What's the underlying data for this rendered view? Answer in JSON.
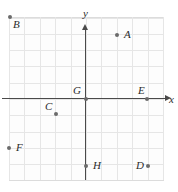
{
  "figure": {
    "background_color": "#ffffff",
    "grid_color": "#e6e6e6",
    "axis_color": "#4a4a4a",
    "point_color": "#6b6b6b",
    "label_color": "#2b2b2b"
  },
  "axes": {
    "x_label": "x",
    "y_label": "y",
    "origin_px": {
      "x": 86,
      "y": 99
    },
    "unit_px": {
      "x": 15.4,
      "y": 16.3
    },
    "x_range": [
      -5,
      5
    ],
    "y_range": [
      -5,
      5
    ],
    "grid": "on",
    "tick_labels": []
  },
  "chart_data": {
    "type": "scatter",
    "title": "",
    "xlabel": "x",
    "ylabel": "y",
    "xlim": [
      -5,
      5
    ],
    "ylim": [
      -5,
      5
    ],
    "grid": true,
    "legend": "none",
    "points": [
      {
        "label": "A",
        "x": 2,
        "y": 4,
        "px": 117,
        "py": 35,
        "label_px": 124,
        "label_py": 29,
        "label_side": "right"
      },
      {
        "label": "B",
        "x": -5,
        "y": 5,
        "px": 10,
        "py": 17,
        "label_px": 13,
        "label_py": 19,
        "label_side": "below-right"
      },
      {
        "label": "C",
        "x": -2,
        "y": -1,
        "px": 56,
        "py": 114,
        "label_px": 45,
        "label_py": 101,
        "label_side": "above-left"
      },
      {
        "label": "D",
        "x": 4,
        "y": -4,
        "px": 148,
        "py": 166,
        "label_px": 136,
        "label_py": 160,
        "label_side": "left"
      },
      {
        "label": "E",
        "x": 4,
        "y": 0,
        "px": 147,
        "py": 99,
        "label_px": 138,
        "label_py": 85,
        "label_side": "above-left"
      },
      {
        "label": "F",
        "x": -5,
        "y": -3,
        "px": 9,
        "py": 148,
        "label_px": 16,
        "label_py": 142,
        "label_side": "right"
      },
      {
        "label": "G",
        "x": 0,
        "y": 0,
        "px": 86,
        "py": 99,
        "label_px": 73,
        "label_py": 85,
        "label_side": "above-left"
      },
      {
        "label": "H",
        "x": 0,
        "y": -4,
        "px": 86,
        "py": 166,
        "label_px": 93,
        "label_py": 160,
        "label_side": "right"
      }
    ]
  }
}
